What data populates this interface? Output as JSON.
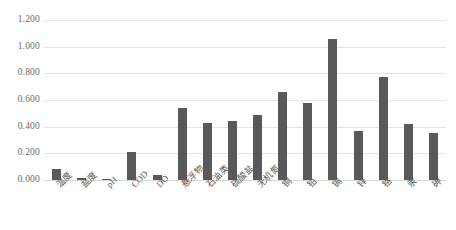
{
  "chart_data": {
    "type": "bar",
    "title": "",
    "xlabel": "",
    "ylabel": "",
    "ylim": [
      0.0,
      1.2
    ],
    "ytick_labels": [
      "0.000",
      "0.200",
      "0.400",
      "0.600",
      "0.800",
      "1.000",
      "1.200"
    ],
    "ytick_values": [
      0.0,
      0.2,
      0.4,
      0.6,
      0.8,
      1.0,
      1.2
    ],
    "grid": true,
    "legend": false,
    "bar_color": "#595959",
    "gridline_color": "#e4e4e4",
    "categories": [
      "温度",
      "盐度",
      "pH",
      "COD",
      "DO",
      "悬浮物",
      "石油类",
      "硫酸盐",
      "无机氮",
      "铜",
      "铅",
      "镉",
      "锌",
      "铬",
      "汞",
      "砷"
    ],
    "values": [
      0.08,
      0.012,
      0.006,
      0.21,
      0.04,
      0.54,
      0.43,
      0.44,
      0.49,
      0.66,
      0.58,
      1.06,
      0.37,
      0.77,
      0.42,
      0.355
    ]
  }
}
